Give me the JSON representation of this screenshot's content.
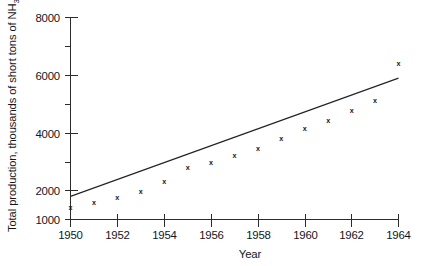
{
  "chart_data": {
    "type": "scatter",
    "title": "",
    "xlabel": "Year",
    "ylabel": "Total production, thousands of short tons of NH3",
    "ylabel_parts": {
      "main": "Total production, thousands of short tons of NH",
      "subscript": "3"
    },
    "xlim": [
      1950,
      1964
    ],
    "ylim": [
      1000,
      8000
    ],
    "grid": false,
    "legend": "none",
    "x_tick_labels": [
      "1950",
      "1952",
      "1954",
      "1956",
      "1958",
      "1960",
      "1962",
      "1964"
    ],
    "x_tick_values": [
      1950,
      1952,
      1954,
      1956,
      1958,
      1960,
      1962,
      1964
    ],
    "y_tick_labels": [
      "1000",
      "2000",
      "4000",
      "6000",
      "8000"
    ],
    "y_tick_values": [
      1000,
      2000,
      4000,
      6000,
      8000
    ],
    "y_minor_tick_values": [
      3000,
      5000,
      7000
    ],
    "marker_symbol": "x",
    "x": [
      1950,
      1951,
      1952,
      1953,
      1954,
      1955,
      1956,
      1957,
      1958,
      1959,
      1960,
      1961,
      1962,
      1963,
      1964
    ],
    "values": [
      1380,
      1570,
      1750,
      1950,
      2300,
      2780,
      2950,
      3200,
      3450,
      3800,
      4150,
      4400,
      4750,
      5100,
      6400
    ],
    "series": [
      {
        "name": "Observed production",
        "type": "scatter",
        "values": [
          1380,
          1570,
          1750,
          1950,
          2300,
          2780,
          2950,
          3200,
          3450,
          3800,
          4150,
          4400,
          4750,
          5100,
          6400
        ]
      },
      {
        "name": "Fitted trend line",
        "type": "line",
        "x": [
          1950,
          1964
        ],
        "values": [
          1800,
          5900
        ]
      }
    ],
    "annotations": []
  },
  "colors": {
    "ink": "#14161a",
    "axis": "#2b2b2b",
    "line": "#22242a",
    "background": "#ffffff"
  }
}
